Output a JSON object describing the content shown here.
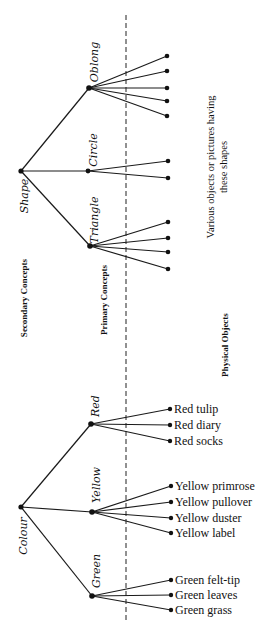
{
  "diagram": {
    "title": "",
    "column_headings": {
      "secondary": "Secondary Concepts",
      "primary": "Primary Concepts",
      "physical": "Physical Objects"
    },
    "shape_objects_note": {
      "line1": "Various objects or pictures having",
      "line2": "these shapes"
    },
    "trees": [
      {
        "secondary": "Shape",
        "primaries": [
          {
            "label": "Oblong",
            "leaf_count": 5,
            "leaves": []
          },
          {
            "label": "Circle",
            "leaf_count": 2,
            "leaves": []
          },
          {
            "label": "Triangle",
            "leaf_count": 4,
            "leaves": []
          }
        ]
      },
      {
        "secondary": "Colour",
        "primaries": [
          {
            "label": "Red",
            "leaves": [
              "Red tulip",
              "Red diary",
              "Red socks"
            ]
          },
          {
            "label": "Yellow",
            "leaves": [
              "Yellow primrose",
              "Yellow pullover",
              "Yellow duster",
              "Yellow label"
            ]
          },
          {
            "label": "Green",
            "leaves": [
              "Green felt-tip",
              "Green leaves",
              "Green grass"
            ]
          }
        ]
      }
    ],
    "colors": {
      "ink": "#111111",
      "background": "#ffffff"
    }
  }
}
